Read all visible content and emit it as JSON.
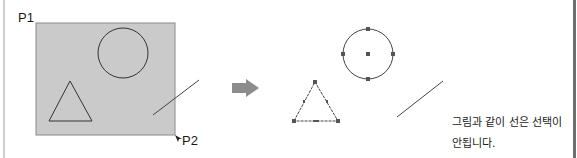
{
  "diagram": {
    "before": {
      "label_p1": "P1",
      "label_p2": "P2",
      "selection_rect": {
        "x": 36,
        "y": 23,
        "width": 139,
        "height": 112,
        "fill": "#cacaca",
        "stroke": "#8a8a8a"
      },
      "shapes": {
        "circle": {
          "cx": 123,
          "cy": 53,
          "r": 25
        },
        "triangle": {
          "points": "49,121 70,81 92,121"
        },
        "line": {
          "x1": 153,
          "y1": 115,
          "x2": 199,
          "y2": 80
        }
      }
    },
    "arrow": {
      "color": "#8c8c8c",
      "icon": "right-arrow-icon"
    },
    "after": {
      "circle": {
        "cx": 368,
        "cy": 54,
        "r": 25
      },
      "triangle": {
        "points": "294,121 315,82 338,121"
      },
      "line": {
        "x1": 397,
        "y1": 117,
        "x2": 443,
        "y2": 81
      },
      "grip_color": "#555555"
    },
    "caption": {
      "line1": "그림과 같이 선은 선택이",
      "line2": "안됩니다."
    }
  }
}
